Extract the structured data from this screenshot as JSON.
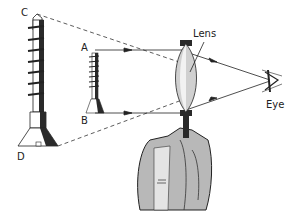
{
  "diagram": {
    "labels": {
      "top_large": "C",
      "bottom_large": "D",
      "top_small": "A",
      "bottom_small": "B",
      "lens": "Lens",
      "eye": "Eye"
    },
    "elements": {
      "virtual_image": "large screw (virtual image) C-D",
      "object": "small screw (object) A-B",
      "lens": "convex lens held in hand",
      "eye": "eye-icon"
    },
    "colors": {
      "line": "#222222",
      "lens_fill": "#d0d0d0",
      "hand_fill": "#b8b8b8",
      "shadow": "#2a2a2a"
    }
  }
}
